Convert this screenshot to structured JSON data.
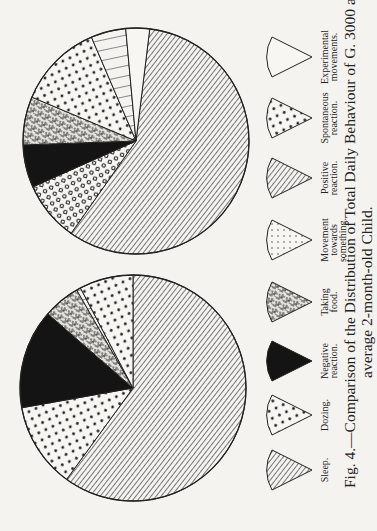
{
  "caption": {
    "line1": "Fig. 4.—Comparison of the Distribution of Total Daily Behaviour of G. 3000 and of the",
    "line2": "average 2-month-old Child."
  },
  "legend": [
    {
      "key": "sleep",
      "label": [
        "Sleep."
      ],
      "pattern": "diag-hatch"
    },
    {
      "key": "dozing",
      "label": [
        "Dozing."
      ],
      "pattern": "dots"
    },
    {
      "key": "negative",
      "label": [
        "Negative",
        "reaction."
      ],
      "pattern": "solid-black"
    },
    {
      "key": "taking_food",
      "label": [
        "Taking",
        "food."
      ],
      "pattern": "mottled"
    },
    {
      "key": "movement",
      "label": [
        "Movement",
        "towards",
        "something."
      ],
      "pattern": "fine-dots"
    },
    {
      "key": "positive",
      "label": [
        "Positive",
        "reaction."
      ],
      "pattern": "lines"
    },
    {
      "key": "spontaneous",
      "label": [
        "Spontaneous",
        "reaction."
      ],
      "pattern": "dots"
    },
    {
      "key": "experimental",
      "label": [
        "Experimental",
        "movements."
      ],
      "pattern": "white"
    }
  ],
  "chart_data": [
    {
      "type": "pie",
      "title": "G. 3000 (Total Daily Behaviour)",
      "position": "upper",
      "categories": [
        "Sleep",
        "Movement towards something",
        "Negative reaction",
        "Taking food",
        "Spontaneous reaction",
        "Positive reaction",
        "Experimental movements"
      ],
      "values": [
        57.8,
        8.6,
        6.1,
        6.9,
        12.2,
        5.0,
        3.4
      ],
      "unit": "% of day (estimated from slice angles)"
    },
    {
      "type": "pie",
      "title": "Average 2-month-old Child (Total Daily Behaviour)",
      "position": "lower",
      "categories": [
        "Sleep",
        "Dozing",
        "Negative reaction",
        "Taking food",
        "Positive reaction",
        "Spontaneous reaction"
      ],
      "values": [
        60.0,
        12.2,
        14.2,
        5.3,
        0.6,
        7.7
      ],
      "unit": "% of day (estimated from slice angles)"
    }
  ],
  "colors": {
    "paper": "#f4f3ef",
    "ink": "#1a1a1a"
  }
}
